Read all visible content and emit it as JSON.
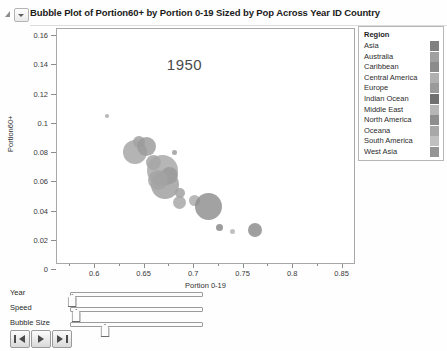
{
  "window": {
    "title": "Bubble Plot of Portion60+  by Portion 0-19 Sized by Pop Across Year ID Country",
    "disclosure_icon": "disclosure-triangle-icon",
    "menu_icon": "chevron-down-icon"
  },
  "chart_data": {
    "type": "scatter",
    "title": "Bubble Plot of Portion60+  by Portion 0-19 Sized by Pop Across Year ID Country",
    "annotation": "1950",
    "xlabel": "Portion 0-19",
    "ylabel": "Portion60+",
    "xlim": [
      0.5625,
      0.8625
    ],
    "ylim": [
      0,
      0.16
    ],
    "xticks": [
      "0.6",
      "0.65",
      "0.7",
      "0.75",
      "0.8",
      "0.85"
    ],
    "xtick_values": [
      0.6,
      0.65,
      0.7,
      0.75,
      0.8,
      0.85
    ],
    "yticks": [
      "0",
      "0.02",
      "0.04",
      "0.06",
      "0.08",
      "0.1",
      "0.12",
      "0.14",
      "0.16"
    ],
    "ytick_values": [
      0,
      0.02,
      0.04,
      0.06,
      0.08,
      0.1,
      0.12,
      0.14,
      0.16
    ],
    "grid": false,
    "legend_position": "right",
    "size_variable": "Pop",
    "color_variable": "Region",
    "points": [
      {
        "x": 0.613,
        "y": 0.1005,
        "r": 2.0,
        "c": "#a8a8a8"
      },
      {
        "x": 0.6455,
        "y": 0.0825,
        "r": 6.0,
        "c": "#9d9d9d"
      },
      {
        "x": 0.6415,
        "y": 0.076,
        "r": 12.0,
        "c": "#a4a4a4"
      },
      {
        "x": 0.6525,
        "y": 0.0795,
        "r": 9.5,
        "c": "#9a9a9a"
      },
      {
        "x": 0.66,
        "y": 0.069,
        "r": 7.5,
        "c": "#a0a0a0"
      },
      {
        "x": 0.669,
        "y": 0.063,
        "r": 15.5,
        "c": "#a6a6a6"
      },
      {
        "x": 0.6765,
        "y": 0.0595,
        "r": 8.5,
        "c": "#989898"
      },
      {
        "x": 0.672,
        "y": 0.053,
        "r": 14.0,
        "c": "#9e9e9e"
      },
      {
        "x": 0.6645,
        "y": 0.057,
        "r": 10.0,
        "c": "#a3a3a3"
      },
      {
        "x": 0.681,
        "y": 0.0755,
        "r": 2.2,
        "c": "#9b9b9b"
      },
      {
        "x": 0.687,
        "y": 0.048,
        "r": 5.0,
        "c": "#9f9f9f"
      },
      {
        "x": 0.6865,
        "y": 0.0415,
        "r": 6.5,
        "c": "#a5a5a5"
      },
      {
        "x": 0.7015,
        "y": 0.043,
        "r": 5.5,
        "c": "#a9a9a9"
      },
      {
        "x": 0.7155,
        "y": 0.0385,
        "r": 13.5,
        "c": "#8e8e8e"
      },
      {
        "x": 0.7265,
        "y": 0.0245,
        "r": 3.5,
        "c": "#868686"
      },
      {
        "x": 0.7395,
        "y": 0.0215,
        "r": 2.6,
        "c": "#b2b2b2"
      },
      {
        "x": 0.762,
        "y": 0.0225,
        "r": 7.0,
        "c": "#8a8a8a"
      }
    ]
  },
  "legend": {
    "title": "Region",
    "items": [
      {
        "label": "Asia",
        "color": "#808080"
      },
      {
        "label": "Australia",
        "color": "#a0a0a0"
      },
      {
        "label": "Caribbean",
        "color": "#8b8b8b"
      },
      {
        "label": "Central America",
        "color": "#b0b0b0"
      },
      {
        "label": "Europe",
        "color": "#9a9a9a"
      },
      {
        "label": "Indian Ocean",
        "color": "#6f6f6f"
      },
      {
        "label": "Middle East",
        "color": "#b6b6b6"
      },
      {
        "label": "North America",
        "color": "#8e8e8e"
      },
      {
        "label": "Oceana",
        "color": "#a8a8a8"
      },
      {
        "label": "South America",
        "color": "#c0c0c0"
      },
      {
        "label": "West Asia",
        "color": "#949494"
      }
    ]
  },
  "controls": {
    "sliders": [
      {
        "label": "Year",
        "value_pct": 1
      },
      {
        "label": "Speed",
        "value_pct": 4
      },
      {
        "label": "Bubble Size",
        "value_pct": 26
      }
    ],
    "buttons": [
      {
        "name": "step-back-button",
        "icon": "step-back-icon"
      },
      {
        "name": "play-button",
        "icon": "play-icon"
      },
      {
        "name": "step-forward-button",
        "icon": "step-forward-icon"
      }
    ]
  }
}
